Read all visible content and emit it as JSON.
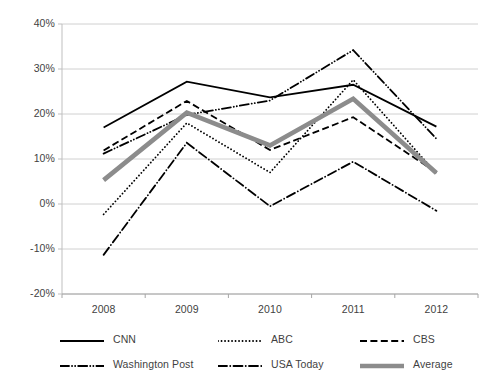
{
  "chart_data": {
    "type": "line",
    "title": "",
    "xlabel": "",
    "ylabel": "",
    "categories": [
      "2008",
      "2009",
      "2010",
      "2011",
      "2012"
    ],
    "x": [
      2008,
      2009,
      2010,
      2011,
      2012
    ],
    "ylim": [
      -20,
      40
    ],
    "ytick_values": [
      40,
      30,
      20,
      10,
      0,
      -10,
      -20
    ],
    "ytick_labels": [
      "40%",
      "30%",
      "20%",
      "10%",
      "0%",
      "-10%",
      "-20%"
    ],
    "grid": "horizontal",
    "legend_position": "bottom",
    "series": [
      {
        "name": "CNN",
        "style": "solid",
        "color": "#000000",
        "width": 1.8,
        "values": [
          17.0,
          27.2,
          23.7,
          26.5,
          17.2
        ]
      },
      {
        "name": "ABC",
        "style": "dotted",
        "color": "#000000",
        "width": 1.8,
        "values": [
          -2.3,
          18.0,
          7.0,
          27.6,
          6.8
        ]
      },
      {
        "name": "CBS",
        "style": "dashed",
        "color": "#000000",
        "width": 1.8,
        "values": [
          11.9,
          22.9,
          12.0,
          19.3,
          7.0
        ]
      },
      {
        "name": "Washington Post",
        "style": "dash-dot-dot",
        "color": "#000000",
        "width": 1.8,
        "values": [
          11.2,
          19.8,
          23.0,
          34.2,
          14.5
        ]
      },
      {
        "name": "USA Today",
        "style": "dash-dot",
        "color": "#000000",
        "width": 1.8,
        "values": [
          -11.3,
          13.6,
          -0.5,
          9.4,
          -1.5
        ]
      },
      {
        "name": "Average",
        "style": "solid",
        "color": "#8c8c8c",
        "width": 4.6,
        "values": [
          5.3,
          20.3,
          13.0,
          23.4,
          6.9
        ]
      }
    ]
  },
  "legend": {
    "rows": [
      [
        {
          "label": "CNN",
          "swatch": "solid-black-line-swatch"
        },
        {
          "label": "ABC",
          "swatch": "dotted-black-line-swatch"
        },
        {
          "label": "CBS",
          "swatch": "dashed-black-line-swatch"
        }
      ],
      [
        {
          "label": "Washington Post",
          "swatch": "dash-dot-dot-black-line-swatch"
        },
        {
          "label": "USA Today",
          "swatch": "dash-dot-black-line-swatch"
        },
        {
          "label": "Average",
          "swatch": "thick-gray-line-swatch"
        }
      ]
    ]
  },
  "axes": {
    "plot_area": {
      "left": 62,
      "right": 478,
      "top": 24,
      "bottom": 294
    },
    "axis_color": "#bfbfbf",
    "grid_color": "#d0d0d0",
    "label_color": "#3f3f3f"
  }
}
